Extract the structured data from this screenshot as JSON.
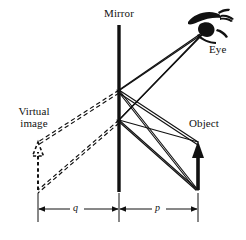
{
  "figure": {
    "width": 246,
    "height": 240,
    "background_color": "#ffffff",
    "ink_color": "#111111"
  },
  "labels": {
    "mirror": "Mirror",
    "eye": "Eye",
    "object": "Object",
    "virtual_image": "Virtual image",
    "virtual_image_line1": "Virtual",
    "virtual_image_line2": "image",
    "distance_image": "q",
    "distance_object": "p"
  },
  "elements": {
    "mirror": {
      "name": "mirror-line",
      "style": "solid",
      "x": 119,
      "y_top": 25,
      "y_bottom": 192,
      "thickness": 3.2,
      "color": "#111111"
    },
    "object": {
      "name": "object-arrow",
      "style": "solid",
      "x": 198,
      "y_base": 190,
      "y_tip": 142,
      "thickness": 3.2,
      "arrowhead": "up",
      "color": "#111111"
    },
    "virtual_image": {
      "name": "virtual-image-arrow",
      "style": "dashed",
      "x": 38,
      "y_base": 190,
      "y_tip": 142,
      "thickness": 2,
      "arrowhead": "up",
      "color": "#111111"
    },
    "eye": {
      "name": "eye-drawing",
      "x": 206,
      "y": 28,
      "color": "#111111"
    }
  },
  "rays": {
    "incident": [
      {
        "from": "object-tip",
        "from_x": 198,
        "from_y": 142,
        "to_x": 119,
        "to_y": 90
      },
      {
        "from": "object-tip",
        "from_x": 198,
        "from_y": 142,
        "to_x": 119,
        "to_y": 120
      },
      {
        "from": "object-base",
        "from_x": 198,
        "from_y": 190,
        "to_x": 119,
        "to_y": 90
      },
      {
        "from": "object-base",
        "from_x": 198,
        "from_y": 190,
        "to_x": 119,
        "to_y": 120
      }
    ],
    "reflected": [
      {
        "from_x": 119,
        "from_y": 90,
        "to_x": 206,
        "to_y": 30
      },
      {
        "from_x": 119,
        "from_y": 120,
        "to_x": 206,
        "to_y": 30
      },
      {
        "from_x": 119,
        "from_y": 90,
        "to_x": 206,
        "to_y": 30
      },
      {
        "from_x": 119,
        "from_y": 120,
        "to_x": 206,
        "to_y": 30
      }
    ],
    "virtual_extensions": [
      {
        "from_x": 119,
        "from_y": 90,
        "to_x": 38,
        "to_y": 142,
        "style": "dashed"
      },
      {
        "from_x": 119,
        "from_y": 120,
        "to_x": 38,
        "to_y": 142,
        "style": "dashed"
      },
      {
        "from_x": 119,
        "from_y": 90,
        "to_x": 38,
        "to_y": 190,
        "style": "dashed"
      },
      {
        "from_x": 119,
        "from_y": 120,
        "to_x": 38,
        "to_y": 190,
        "style": "dashed"
      }
    ]
  },
  "dimensions": {
    "baseline_y": 209,
    "image_distance": {
      "label": "q",
      "x_start": 38,
      "x_end": 119,
      "arrow_both_ends": true
    },
    "object_distance": {
      "label": "p",
      "x_start": 119,
      "x_end": 198,
      "arrow_both_ends": true
    },
    "extension_lines": [
      {
        "x": 38,
        "y_top": 192,
        "y_bottom": 222
      },
      {
        "x": 119,
        "y_top": 192,
        "y_bottom": 222
      },
      {
        "x": 198,
        "y_top": 192,
        "y_bottom": 222
      }
    ]
  }
}
